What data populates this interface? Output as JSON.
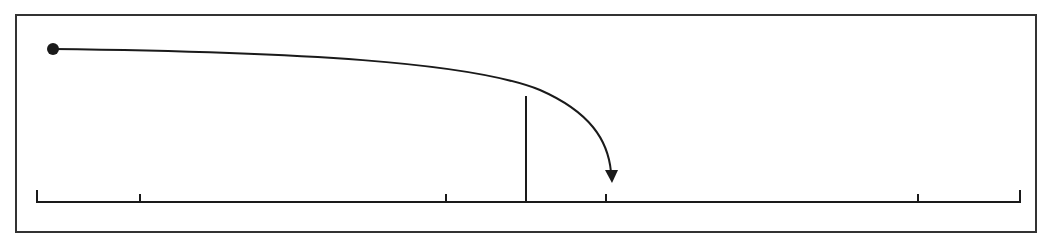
{
  "diagram": {
    "colors": {
      "stroke": "#1a1a1a",
      "background": "#ffffff",
      "frame": "#333333"
    },
    "frame": {
      "x": 16,
      "y": 15,
      "width": 1020,
      "height": 217
    },
    "start_point": {
      "x": 53,
      "y": 49,
      "radius": 6
    },
    "baseline": {
      "y": 202,
      "x_start": 37,
      "x_end": 1020
    },
    "ticks": [
      {
        "x": 37,
        "height": 12
      },
      {
        "x": 140,
        "height": 8
      },
      {
        "x": 446,
        "height": 8
      },
      {
        "x": 606,
        "height": 8
      },
      {
        "x": 918,
        "height": 8
      },
      {
        "x": 1020,
        "height": 12
      }
    ],
    "barrier": {
      "x": 526,
      "y_top": 96,
      "y_bottom": 202
    },
    "trajectory": {
      "path": "M 53 49 C 300 52, 470 62, 540 90 C 590 112, 608 140, 611 172",
      "arrow_tip": {
        "x": 612,
        "y": 183
      }
    }
  }
}
